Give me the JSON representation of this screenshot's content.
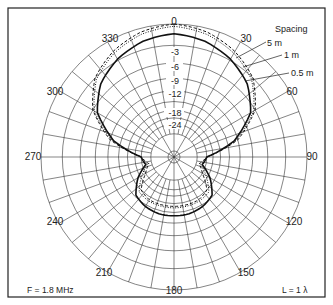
{
  "chart_data": {
    "type": "polar",
    "title": "",
    "angle_unit": "degrees",
    "angle_ticks": [
      0,
      30,
      60,
      90,
      120,
      150,
      180,
      210,
      240,
      270,
      300,
      330
    ],
    "angle_tick_labels": [
      "0",
      "30",
      "60",
      "90",
      "120",
      "150",
      "180",
      "210",
      "240",
      "270",
      "300",
      "330"
    ],
    "radial_ticks_db": [
      -3,
      -6,
      -9,
      -12,
      -18,
      -24
    ],
    "radial_tick_labels": [
      "-3",
      "-6",
      "-9",
      "-12",
      "-18",
      "-24"
    ],
    "radial_scale": "ARRL log (dB)",
    "grid": true,
    "legend_title": "Spacing",
    "series": [
      {
        "name": "5 m",
        "style": "dashed",
        "angles": [
          0,
          15,
          30,
          45,
          60,
          75,
          90,
          105,
          120,
          135,
          150,
          165,
          180,
          195,
          210,
          225,
          240,
          255,
          270,
          285,
          300,
          315,
          330,
          345
        ],
        "gain_db": [
          0,
          -0.5,
          -1.5,
          -3,
          -6,
          -12,
          -24,
          -28,
          -24,
          -18,
          -17,
          -17,
          -17,
          -17,
          -17,
          -18,
          -24,
          -28,
          -24,
          -12,
          -6,
          -3,
          -1.5,
          -0.5
        ]
      },
      {
        "name": "1 m",
        "style": "dotted",
        "angles": [
          0,
          15,
          30,
          45,
          60,
          75,
          90,
          105,
          120,
          135,
          150,
          165,
          180,
          195,
          210,
          225,
          240,
          255,
          270,
          285,
          300,
          315,
          330,
          345
        ],
        "gain_db": [
          -0.3,
          -0.8,
          -1.8,
          -3.3,
          -6.3,
          -12.5,
          -24,
          -27,
          -22,
          -17,
          -16.5,
          -16.5,
          -16.5,
          -16.5,
          -16.5,
          -17,
          -22,
          -27,
          -24,
          -12.5,
          -6.3,
          -3.3,
          -1.8,
          -0.8
        ]
      },
      {
        "name": "0.5 m",
        "style": "solid",
        "angles": [
          0,
          15,
          30,
          45,
          60,
          75,
          90,
          105,
          120,
          135,
          150,
          165,
          180,
          195,
          210,
          225,
          240,
          255,
          270,
          285,
          300,
          315,
          330,
          345
        ],
        "gain_db": [
          -1.3,
          -1.8,
          -2.8,
          -4.3,
          -7,
          -13,
          -24,
          -26,
          -20,
          -15.5,
          -14.5,
          -14,
          -14,
          -14,
          -14.5,
          -15.5,
          -20,
          -26,
          -24,
          -13,
          -7,
          -4.3,
          -2.8,
          -1.8
        ]
      }
    ],
    "annotations": [
      "F = 1.8 MHz",
      "L = 1 λ"
    ]
  },
  "labels": {
    "angles": {
      "a0": "0",
      "a30": "30",
      "a60": "60",
      "a90": "90",
      "a120": "120",
      "a150": "150",
      "a180": "180",
      "a210": "210",
      "a240": "240",
      "a270": "270",
      "a300": "300",
      "a330": "330"
    },
    "radial": {
      "r3": "-3",
      "r6": "-6",
      "r9": "-9",
      "r12": "-12",
      "r18": "-18",
      "r24": "-24"
    },
    "legend": {
      "title": "Spacing",
      "s5": "5 m",
      "s1": "1 m",
      "s05": "0.5 m"
    },
    "freq": "F = 1.8 MHz",
    "length": "L = 1 λ"
  }
}
